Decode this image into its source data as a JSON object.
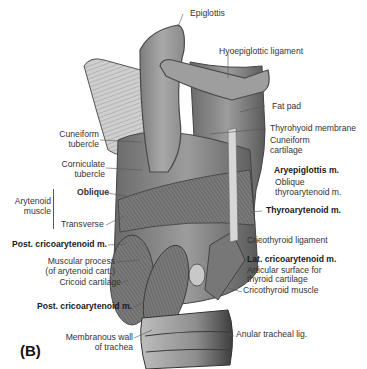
{
  "figure": {
    "panel_label": "(B)",
    "labels": {
      "epiglottis": "Epiglottis",
      "hyoepiglottic_ligament": "Hyoepiglottic ligament",
      "fat_pad": "Fat pad",
      "thyrohyoid_membrane": "Thyrohyoid membrane",
      "cuneiform_cartilage_1": "Cuneiform",
      "cuneiform_cartilage_2": "cartilage",
      "aryepiglottis": "Aryepiglottis m.",
      "oblique_thyroarytenoid_1": "Oblique",
      "oblique_thyroarytenoid_2": "thyroarytenoid m.",
      "thyroarytenoid": "Thyroarytenoid m.",
      "cricothyroid_ligament": "Cricothyroid ligament",
      "lat_cricoarytenoid": "Lat. cricoarytenoid m.",
      "articular_surface_1": "Articular surface for",
      "articular_surface_2": "thyroid cartilage",
      "cricothyroid_muscle": "Cricothyroid muscle",
      "anular_tracheal": "Anular tracheal lig.",
      "cuneiform_tubercle_1": "Cuneiform",
      "cuneiform_tubercle_2": "tubercle",
      "corniculate_tubercle_1": "Corniculate",
      "corniculate_tubercle_2": "tubercle",
      "arytenoid_muscle_1": "Arytenoid",
      "arytenoid_muscle_2": "muscle",
      "oblique": "Oblique",
      "transverse": "Transverse",
      "post_cricoarytenoid_1": "Post. cricoarytenoid m.",
      "muscular_process_1": "Muscular process",
      "muscular_process_2": "(of arytenoid cart.)",
      "cricoid_cartilage": "Cricoid cartilage",
      "post_cricoarytenoid_2": "Post. cricoarytenoid m.",
      "membranous_wall_1": "Membranous wall",
      "membranous_wall_2": "of trachea"
    },
    "colors": {
      "background": "#ffffff",
      "tissue_light": "#b8b8b8",
      "tissue_mid": "#8c8c8c",
      "tissue_dark": "#555555",
      "muscle": "#6e6e6e",
      "text": "#2a2a2a"
    }
  }
}
